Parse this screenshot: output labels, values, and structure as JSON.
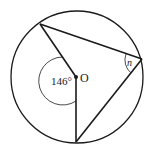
{
  "diagram": {
    "type": "circle-geometry",
    "circle": {
      "cx": 77,
      "cy": 77,
      "r": 67
    },
    "center": {
      "label": "O",
      "x": 76,
      "y": 77
    },
    "points": {
      "A": {
        "x": 40,
        "y": 24
      },
      "B": {
        "x": 142,
        "y": 59
      },
      "C": {
        "x": 76,
        "y": 142
      }
    },
    "angles": {
      "central": {
        "label": "146°",
        "value": 146
      },
      "inscribed": {
        "label": "n"
      }
    },
    "colors": {
      "stroke": "#1a1a1a",
      "background": "#ffffff"
    }
  }
}
